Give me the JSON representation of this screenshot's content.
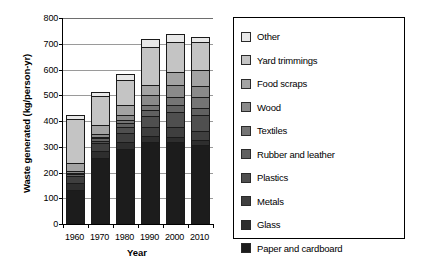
{
  "chart_data": {
    "type": "bar",
    "subtype": "stacked-bar",
    "title": "",
    "xlabel": "Year",
    "ylabel": "Waste generated (kg/person-yr)",
    "categories": [
      "1960",
      "1970",
      "1980",
      "1990",
      "2000",
      "2010"
    ],
    "ylim": [
      0,
      800
    ],
    "yticks": [
      0,
      100,
      200,
      300,
      400,
      500,
      600,
      700,
      800
    ],
    "grid": true,
    "legend_position": "right",
    "series": [
      {
        "name": "Paper and cardboard",
        "color": "#1c1c1c",
        "values": [
          133,
          258,
          290,
          320,
          320,
          308
        ]
      },
      {
        "name": "Glass",
        "color": "#2e2e2e",
        "values": [
          28,
          30,
          32,
          24,
          22,
          20
        ]
      },
      {
        "name": "Metals",
        "color": "#3f3f3f",
        "values": [
          32,
          33,
          38,
          40,
          42,
          40
        ]
      },
      {
        "name": "Plastics",
        "color": "#4f4f4f",
        "values": [
          3,
          12,
          26,
          46,
          62,
          64
        ]
      },
      {
        "name": "Rubber and leather",
        "color": "#616161",
        "values": [
          9,
          12,
          18,
          24,
          30,
          32
        ]
      },
      {
        "name": "Textiles",
        "color": "#757575",
        "values": [
          9,
          10,
          14,
          22,
          34,
          44
        ]
      },
      {
        "name": "Wood",
        "color": "#8a8a8a",
        "values": [
          9,
          14,
          26,
          44,
          48,
          48
        ]
      },
      {
        "name": "Food scraps",
        "color": "#a3a3a3",
        "values": [
          35,
          36,
          40,
          42,
          54,
          64
        ]
      },
      {
        "name": "Yard trimmings",
        "color": "#c4c4c4",
        "values": [
          172,
          118,
          100,
          150,
          120,
          110
        ]
      },
      {
        "name": "Other",
        "color": "#e8e8e8",
        "values": [
          20,
          17,
          26,
          36,
          33,
          25
        ]
      }
    ],
    "totals": [
      450,
      540,
      610,
      748,
      765,
      755
    ]
  },
  "legend": {
    "items": [
      {
        "label": "Other"
      },
      {
        "label": "Yard trimmings"
      },
      {
        "label": "Food scraps"
      },
      {
        "label": "Wood"
      },
      {
        "label": "Textiles"
      },
      {
        "label": "Rubber and leather"
      },
      {
        "label": "Plastics"
      },
      {
        "label": "Metals"
      },
      {
        "label": "Glass"
      },
      {
        "label": "Paper and cardboard"
      }
    ]
  }
}
